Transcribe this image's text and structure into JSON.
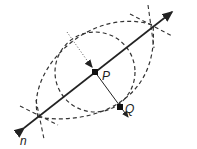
{
  "diagram": {
    "labels": {
      "point_p": "P",
      "point_q": "Q",
      "line_n": "n"
    },
    "colors": {
      "line": "#222222",
      "dashed": "#333333",
      "background": "#ffffff"
    }
  }
}
